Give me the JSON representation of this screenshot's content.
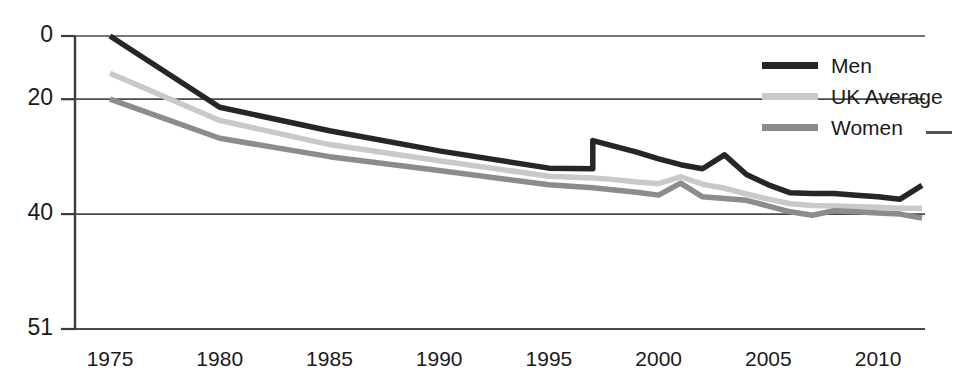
{
  "chart_data": {
    "type": "line",
    "title": "",
    "xlabel": "",
    "ylabel": "",
    "x": [
      1975,
      1980,
      1985,
      1990,
      1995,
      1997,
      1997,
      1998,
      1999,
      2000,
      2001,
      2002,
      2003,
      2004,
      2005,
      2006,
      2007,
      2008,
      2009,
      2010,
      2011,
      2012
    ],
    "xlim": [
      1975,
      2012
    ],
    "ylim": [
      0,
      51
    ],
    "yticks": [
      0,
      20,
      40,
      51
    ],
    "xticks": [
      1975,
      1980,
      1985,
      1990,
      1995,
      2000,
      2005,
      2010
    ],
    "grid": true,
    "legend_position": "top-right",
    "series": [
      {
        "name": "Men",
        "color": "#262626",
        "width": 5.5,
        "values": [
          51.0,
          38.6,
          34.5,
          31.0,
          28.0,
          27.9,
          32.8,
          31.8,
          30.8,
          29.6,
          28.6,
          27.9,
          30.3,
          26.9,
          25.1,
          23.7,
          23.6,
          23.6,
          23.3,
          23.0,
          22.6,
          25.0
        ]
      },
      {
        "name": "UK Average",
        "color": "#c9c9c9",
        "width": 5.5,
        "values": [
          44.5,
          36.3,
          32.1,
          29.3,
          26.6,
          26.3,
          26.3,
          26.0,
          25.6,
          25.3,
          26.5,
          25.2,
          24.5,
          23.5,
          22.6,
          21.8,
          21.5,
          21.4,
          21.3,
          21.2,
          21.0,
          21.0
        ]
      },
      {
        "name": "Women",
        "color": "#8c8c8c",
        "width": 5.5,
        "values": [
          40.0,
          33.2,
          30.0,
          27.6,
          25.1,
          24.6,
          24.6,
          24.2,
          23.8,
          23.3,
          25.4,
          23.0,
          22.7,
          22.4,
          21.4,
          20.4,
          19.8,
          20.6,
          20.4,
          20.2,
          20.0,
          19.3
        ]
      }
    ],
    "notes": {
      "discontinuity_year": 1997,
      "discontinuity_series": "Men",
      "peak_year_men": 2003,
      "bump_year_women": 2001
    }
  },
  "axes": {
    "y_tick_labels": [
      "51",
      "40",
      "20",
      "0"
    ],
    "x_tick_labels": [
      "1975",
      "1980",
      "1985",
      "1990",
      "1995",
      "2000",
      "2005",
      "2010"
    ]
  },
  "legend": {
    "items": [
      {
        "label": "Men",
        "color": "#262626"
      },
      {
        "label": "UK Average",
        "color": "#c9c9c9"
      },
      {
        "label": "Women",
        "color": "#8c8c8c"
      }
    ]
  },
  "colors": {
    "axis": "#3b3b3b",
    "grid": "#4a4a4a",
    "text": "#1a1a1a",
    "background": "#ffffff"
  },
  "cropped_title": ""
}
